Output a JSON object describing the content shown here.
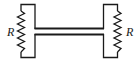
{
  "diagram": {
    "type": "circuit",
    "stroke_color": "#1a1a1a",
    "background": "#ffffff",
    "left_resistor": {
      "label": "R"
    },
    "right_resistor": {
      "label": "R"
    },
    "connector": {
      "type": "double-wire"
    }
  }
}
